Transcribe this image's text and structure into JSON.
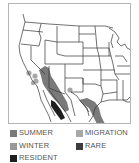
{
  "map": {
    "title": "Range map",
    "colors": {
      "summer": "#7a7a7a",
      "migration": "#a8a8a8",
      "winter": "#9a9a9a",
      "rare": "#3c3c3c",
      "resident": "#1e1e1e",
      "border": "#b5b5b5",
      "lines": "#333333"
    }
  },
  "legend": {
    "items": [
      {
        "key": "summer",
        "label": "SUMMER",
        "color": "#7a7a7a"
      },
      {
        "key": "migration",
        "label": "MIGRATION",
        "color": "#a8a8a8"
      },
      {
        "key": "winter",
        "label": "WINTER",
        "color": "#9a9a9a"
      },
      {
        "key": "rare",
        "label": "RARE",
        "color": "#3c3c3c"
      },
      {
        "key": "resident",
        "label": "RESIDENT",
        "color": "#1e1e1e"
      }
    ]
  }
}
